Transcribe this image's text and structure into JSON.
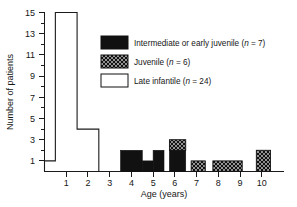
{
  "chart_data": {
    "type": "bar",
    "title": "",
    "xlabel": "Age (years)",
    "ylabel": "Number of patients",
    "xlim": [
      0,
      11
    ],
    "ylim": [
      0,
      15
    ],
    "grid": false,
    "legend_position": "upper-right-inside",
    "x_tick_labels": [
      "1",
      "2",
      "3",
      "4",
      "5",
      "6",
      "7",
      "8",
      "9",
      "10"
    ],
    "x_tick_values": [
      1,
      2,
      3,
      4,
      5,
      6,
      7,
      8,
      9,
      10
    ],
    "y_tick_labels": [
      "1",
      "3",
      "5",
      "7",
      "9",
      "11",
      "13",
      "15"
    ],
    "y_tick_values": [
      1,
      3,
      5,
      7,
      9,
      11,
      13,
      15
    ],
    "y_minor_tick_values": [
      2,
      4,
      6,
      8,
      10,
      12,
      14
    ],
    "bin_width": 1,
    "categories": [
      "0.5",
      "1",
      "2",
      "3",
      "4",
      "5",
      "6",
      "7",
      "8",
      "9",
      "10"
    ],
    "series": [
      {
        "name": "Late infantile",
        "style": "open-outline",
        "color": "#ffffff",
        "edge_color": "#111111",
        "values": [
          1,
          15,
          4,
          0,
          0,
          0,
          0,
          0,
          0,
          0,
          0
        ]
      },
      {
        "name": "Intermediate or early juvenile",
        "style": "solid-black",
        "color": "#111111",
        "edge_color": "#111111",
        "values": [
          0,
          0,
          0,
          0,
          2,
          1,
          2,
          0,
          0,
          0,
          0
        ]
      },
      {
        "name": "Juvenile",
        "style": "cross-hatch",
        "color": "#ffffff",
        "edge_color": "#111111",
        "values": [
          0,
          0,
          0,
          0,
          0,
          0,
          1,
          1,
          1,
          1,
          2
        ]
      }
    ],
    "bars": [
      {
        "center": 0.5,
        "left": 0.0,
        "right": 0.5,
        "solid": 0,
        "hatched": 0,
        "outline": 1
      },
      {
        "center": 1.0,
        "left": 0.5,
        "right": 1.5,
        "solid": 0,
        "hatched": 0,
        "outline": 15
      },
      {
        "center": 2.0,
        "left": 1.5,
        "right": 2.5,
        "solid": 0,
        "hatched": 0,
        "outline": 4
      },
      {
        "center": 3.0,
        "left": 2.5,
        "right": 3.5,
        "solid": 0,
        "hatched": 0,
        "outline": 0
      },
      {
        "center": 4.0,
        "left": 3.5,
        "right": 4.5,
        "solid": 2,
        "hatched": 0,
        "outline": 0
      },
      {
        "center": 4.75,
        "left": 4.5,
        "right": 5.0,
        "solid": 1,
        "hatched": 0,
        "outline": 0
      },
      {
        "center": 5.25,
        "left": 5.0,
        "right": 5.5,
        "solid": 2,
        "hatched": 0,
        "outline": 0
      },
      {
        "center": 6.0,
        "left": 5.75,
        "right": 6.5,
        "solid": 2,
        "hatched": 1,
        "outline": 0
      },
      {
        "center": 7.0,
        "left": 6.75,
        "right": 7.4,
        "solid": 0,
        "hatched": 1,
        "outline": 0
      },
      {
        "center": 8.5,
        "left": 7.75,
        "right": 9.1,
        "solid": 0,
        "hatched": 1,
        "outline": 0
      },
      {
        "center": 10.0,
        "left": 9.75,
        "right": 10.4,
        "solid": 0,
        "hatched": 2,
        "outline": 0
      }
    ],
    "legend": [
      {
        "label_text": "Intermediate or early juvenile (",
        "n_symbol": "n",
        "n_value": " = 7)",
        "swatch": "solid-black"
      },
      {
        "label_text": "Juvenile (",
        "n_symbol": "n",
        "n_value": " = 6)",
        "swatch": "cross-hatch"
      },
      {
        "label_text": "Late infantile (",
        "n_symbol": "n",
        "n_value": " = 24)",
        "swatch": "open-outline"
      }
    ]
  },
  "axes": {
    "x_title": "Age (years)",
    "y_title": "Number of patients"
  },
  "ticks": {
    "x": [
      "1",
      "2",
      "3",
      "4",
      "5",
      "6",
      "7",
      "8",
      "9",
      "10"
    ],
    "y": [
      "1",
      "3",
      "5",
      "7",
      "9",
      "11",
      "13",
      "15"
    ]
  },
  "legend": {
    "entries": [
      {
        "text_before": "Intermediate or early juvenile (",
        "italic": "n",
        "text_after": " = 7)"
      },
      {
        "text_before": "Juvenile (",
        "italic": "n",
        "text_after": " = 6)"
      },
      {
        "text_before": "Late infantile (",
        "italic": "n",
        "text_after": " = 24)"
      }
    ]
  }
}
